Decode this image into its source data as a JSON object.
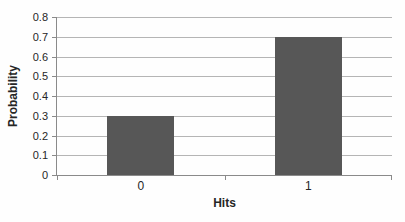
{
  "chart_data": {
    "type": "bar",
    "title": "",
    "xlabel": "Hits",
    "ylabel": "Probability",
    "categories": [
      "0",
      "1"
    ],
    "values": [
      0.3,
      0.7
    ],
    "ylim": [
      0,
      0.8
    ],
    "yticks": [
      0,
      0.1,
      0.2,
      0.3,
      0.4,
      0.5,
      0.6,
      0.7,
      0.8
    ],
    "ytick_labels": [
      "0",
      "0.1",
      "0.2",
      "0.3",
      "0.4",
      "0.5",
      "0.6",
      "0.7",
      "0.8"
    ],
    "grid": true,
    "legend": false,
    "colors": {
      "bar": "#575757",
      "gridline": "#b5b5b5",
      "axis": "#8a8a8a",
      "text": "#262626",
      "background": "#fefefe"
    }
  }
}
